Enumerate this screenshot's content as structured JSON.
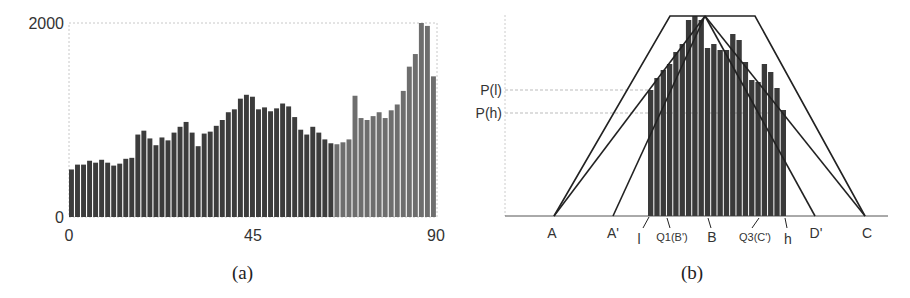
{
  "chart_data": [
    {
      "id": "a",
      "type": "bar",
      "title": "",
      "caption": "(a)",
      "xlabel": "",
      "ylabel": "",
      "xlim": [
        0,
        90
      ],
      "ylim": [
        0,
        2000
      ],
      "x_ticks": [
        "0",
        "45",
        "90"
      ],
      "y_ticks": [
        "0",
        "2000"
      ],
      "grid": false,
      "bar_count": 61,
      "values": [
        490,
        540,
        540,
        580,
        560,
        590,
        560,
        530,
        550,
        600,
        610,
        850,
        890,
        810,
        740,
        820,
        790,
        870,
        930,
        980,
        870,
        730,
        860,
        880,
        940,
        1000,
        1080,
        1110,
        1220,
        1260,
        1240,
        1110,
        1130,
        1090,
        1120,
        1170,
        1140,
        1030,
        900,
        850,
        930,
        870,
        800,
        760,
        750,
        770,
        800,
        1250,
        1020,
        1000,
        1040,
        1080,
        1020,
        1100,
        1160,
        1300,
        1550,
        1680,
        2000,
        1970,
        1450
      ],
      "shade_split_index": 44,
      "colors": {
        "left_bars": "#3c3c3c",
        "right_bars": "#6e6e6e",
        "frame": "#bbbbbb"
      }
    },
    {
      "id": "b",
      "type": "bar",
      "title": "",
      "caption": "(b)",
      "xlabel": "",
      "ylabel": "",
      "y_ticks": [
        "P(l)",
        "P(h)"
      ],
      "x_ticks": [
        "A",
        "A'",
        "l",
        "Q1(B')",
        "B",
        "Q3(C')",
        "h",
        "D'",
        "C"
      ],
      "bar_count": 22,
      "values": [
        0.63,
        0.69,
        0.73,
        0.76,
        0.82,
        0.86,
        0.98,
        1.0,
        0.98,
        0.84,
        0.86,
        0.83,
        0.83,
        0.91,
        0.88,
        0.77,
        0.68,
        0.67,
        0.76,
        0.72,
        0.64,
        0.53
      ],
      "annotations": {
        "outer_trapezoid": [
          "A",
          "top-left",
          "top-right",
          "C"
        ],
        "triangle_1": [
          "A",
          "B-peak",
          "C"
        ],
        "triangle_2": [
          "A'",
          "B-peak",
          "D'"
        ],
        "P(l)_level": 0.59,
        "P(h)_level": 0.48
      }
    }
  ],
  "panel_a": {
    "caption": "(a)",
    "y_top_label": "2000",
    "y_bottom_label": "0",
    "x_labels": [
      "0",
      "45",
      "90"
    ]
  },
  "panel_b": {
    "caption": "(b)",
    "y_labels": [
      "P(l)",
      "P(h)"
    ],
    "x_labels": {
      "A": "A",
      "A_prime": "A'",
      "l": "l",
      "Q1": "Q1(B')",
      "B": "B",
      "Q3": "Q3(C')",
      "h": "h",
      "D_prime": "D'",
      "C": "C"
    }
  }
}
